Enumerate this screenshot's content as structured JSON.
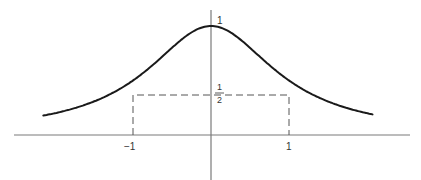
{
  "figure": {
    "type": "function-plot",
    "function": "1/(1+x^2)",
    "labels": {
      "peak": "1",
      "half_num": "1",
      "half_den": "2",
      "x_neg": "−1",
      "x_pos": "1"
    },
    "colors": {
      "curve": "#1a1a1a",
      "axes": "#7a7a7a",
      "dashes": "#555555"
    }
  }
}
